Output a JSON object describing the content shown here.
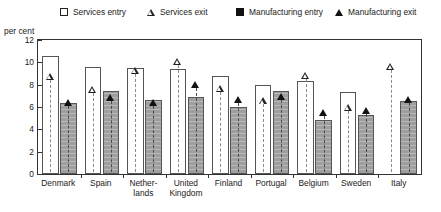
{
  "axis_title": "per cent",
  "legend": [
    {
      "label": "Services entry",
      "symbol": "open-square",
      "color": "#ffffff"
    },
    {
      "label": "Services exit",
      "symbol": "open-triangle",
      "color": "#ffffff"
    },
    {
      "label": "Manufacturing entry",
      "symbol": "filled-square",
      "color": "#111111"
    },
    {
      "label": "Manufacturing exit",
      "symbol": "filled-triangle",
      "color": "#111111"
    }
  ],
  "chart_data": {
    "type": "bar",
    "title": "",
    "subtitle": "",
    "xlabel": "",
    "ylabel": "per cent",
    "ylim": [
      0,
      12
    ],
    "yticks": [
      0,
      2,
      4,
      6,
      8,
      10,
      12
    ],
    "grid": false,
    "legend_position": "top",
    "categories": [
      "Denmark",
      "Spain",
      "Netherlands",
      "United Kingdom",
      "Finland",
      "Portugal",
      "Belgium",
      "Sweden",
      "Italy"
    ],
    "category_labels": [
      [
        "Denmark"
      ],
      [
        "Spain"
      ],
      [
        "Nether-",
        "lands"
      ],
      [
        "United",
        "Kingdom"
      ],
      [
        "Finland"
      ],
      [
        "Portugal"
      ],
      [
        "Belgium"
      ],
      [
        "Sweden"
      ],
      [
        "Italy"
      ]
    ],
    "series": [
      {
        "name": "Services entry",
        "type": "bar",
        "values": [
          10.6,
          9.6,
          9.5,
          9.4,
          8.8,
          8.0,
          8.3,
          7.3,
          null
        ]
      },
      {
        "name": "Services exit",
        "type": "marker",
        "values": [
          8.7,
          7.5,
          9.2,
          10.0,
          7.6,
          6.5,
          8.8,
          5.9,
          9.6
        ]
      },
      {
        "name": "Manufacturing entry",
        "type": "bar",
        "values": [
          6.4,
          7.4,
          6.6,
          6.9,
          6.0,
          7.4,
          4.8,
          5.3,
          6.5
        ]
      },
      {
        "name": "Manufacturing exit",
        "type": "marker",
        "values": [
          6.4,
          6.8,
          6.4,
          8.0,
          6.6,
          6.9,
          5.5,
          5.6,
          6.6
        ]
      }
    ]
  }
}
